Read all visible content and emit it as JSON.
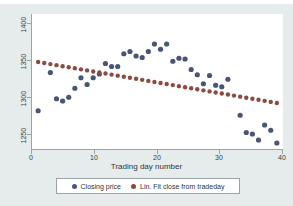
{
  "colors": {
    "background": "#e6ebec",
    "plot_background": "#ffffff",
    "axis": "#9aa3a6",
    "scatter_marker": "#4a5576",
    "fit_marker": "#8b4a42",
    "text": "#2e3539"
  },
  "legend": {
    "entries": [
      {
        "label": "Closing price",
        "color": "#4a5576",
        "icon": "filled-circle-marker"
      },
      {
        "label": "Lin. Fit close from tradeday",
        "color": "#8b4a42",
        "icon": "filled-circle-marker"
      }
    ]
  },
  "axes": {
    "y_ticks": [
      "1400",
      "1350",
      "1300",
      "1250"
    ],
    "x_ticks": [
      "0",
      "10",
      "20",
      "30",
      "40"
    ],
    "xlabel": "Trading day number",
    "ylabel": ""
  },
  "chart_data": {
    "type": "scatter",
    "title": "",
    "subtitle": "",
    "xlabel": "Trading day number",
    "ylabel": "",
    "xlim": [
      0,
      41
    ],
    "ylim": [
      1232,
      1412
    ],
    "grid": false,
    "legend_position": "bottom",
    "x_ticks": [
      0,
      10,
      20,
      30,
      40
    ],
    "y_ticks": [
      1250,
      1300,
      1350,
      1400
    ],
    "series": [
      {
        "name": "Closing price",
        "type": "scatter",
        "color": "#4a5576",
        "marker": "circle",
        "x": [
          1,
          3,
          4,
          5,
          6,
          7,
          8,
          9,
          10,
          11,
          12,
          13,
          14,
          15,
          16,
          17,
          18,
          19,
          20,
          21,
          22,
          23,
          24,
          25,
          26,
          27,
          28,
          29,
          30,
          31,
          32,
          34,
          35,
          36,
          37,
          38,
          39,
          40
        ],
        "y": [
          1283,
          1334,
          1299,
          1296,
          1301,
          1313,
          1327,
          1318,
          1327,
          1332,
          1346,
          1342,
          1342,
          1359,
          1362,
          1356,
          1354,
          1362,
          1372,
          1365,
          1372,
          1349,
          1353,
          1352,
          1338,
          1331,
          1319,
          1330,
          1317,
          1315,
          1325,
          1277,
          1254,
          1252,
          1244,
          1264,
          1257,
          1240
        ]
      },
      {
        "name": "Lin. Fit close from tradeday",
        "type": "scatter",
        "color": "#8b4a42",
        "marker": "circle",
        "x": [
          1,
          2,
          3,
          4,
          5,
          6,
          7,
          8,
          9,
          10,
          11,
          12,
          13,
          14,
          15,
          16,
          17,
          18,
          19,
          20,
          21,
          22,
          23,
          24,
          25,
          26,
          27,
          28,
          29,
          30,
          31,
          32,
          33,
          34,
          35,
          36,
          37,
          38,
          39,
          40
        ],
        "y": [
          1348.0,
          1346.6,
          1345.2,
          1343.8,
          1342.4,
          1341.0,
          1339.6,
          1338.2,
          1336.8,
          1335.4,
          1334.0,
          1332.6,
          1331.2,
          1329.8,
          1328.4,
          1327.0,
          1325.6,
          1324.2,
          1322.8,
          1321.4,
          1320.0,
          1318.6,
          1317.2,
          1315.8,
          1314.4,
          1313.0,
          1311.6,
          1310.2,
          1308.8,
          1307.4,
          1306.0,
          1304.6,
          1303.2,
          1301.8,
          1300.4,
          1299.0,
          1297.6,
          1296.2,
          1294.8,
          1293.4
        ]
      }
    ]
  }
}
